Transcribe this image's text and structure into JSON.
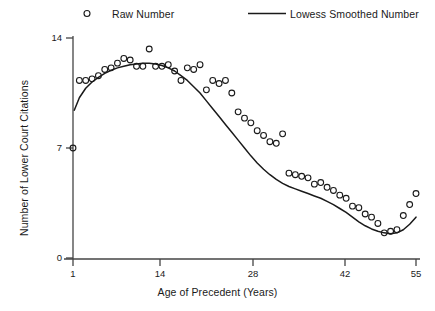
{
  "chart_data": {
    "type": "scatter",
    "title": "",
    "xlabel": "Age of Precedent (Years)",
    "ylabel": "Number of Lower Court Citations",
    "xlim": [
      1,
      55
    ],
    "ylim": [
      0,
      14.8
    ],
    "xticks": [
      1,
      14,
      28,
      42,
      55
    ],
    "yticks": [
      0,
      7,
      14
    ],
    "xtick_labels": [
      "1",
      "14",
      "28",
      "42",
      "55"
    ],
    "ytick_labels": [
      "0",
      "7",
      "14"
    ],
    "grid": false,
    "legend_position": "top",
    "legend": [
      {
        "label": "Raw Number",
        "marker": "circle",
        "color": "#1a1a1a"
      },
      {
        "label": "Lowess Smoothed Number",
        "marker": "line",
        "color": "#1a1a1a"
      }
    ],
    "series": [
      {
        "name": "Raw Number",
        "type": "scatter",
        "marker": "open-circle",
        "x": [
          1,
          2,
          3,
          4,
          5,
          6,
          7,
          8,
          9,
          10,
          11,
          12,
          13,
          14,
          15,
          16,
          17,
          18,
          19,
          20,
          21,
          22,
          23,
          24,
          25,
          26,
          27,
          28,
          29,
          30,
          31,
          32,
          33,
          34,
          35,
          36,
          37,
          38,
          39,
          40,
          41,
          42,
          43,
          44,
          45,
          46,
          47,
          48,
          49,
          50,
          51,
          52,
          53,
          54,
          55
        ],
        "y": [
          7.0,
          11.3,
          11.3,
          11.4,
          11.6,
          12.0,
          12.1,
          12.4,
          12.7,
          12.6,
          12.2,
          12.2,
          13.3,
          12.2,
          12.2,
          12.3,
          11.9,
          11.3,
          12.1,
          12.0,
          12.3,
          10.7,
          11.3,
          11.1,
          11.3,
          10.5,
          9.3,
          8.9,
          8.6,
          8.1,
          7.8,
          7.4,
          7.3,
          7.9,
          5.4,
          5.3,
          5.2,
          5.1,
          4.7,
          4.8,
          4.5,
          4.3,
          4.0,
          3.8,
          3.3,
          3.2,
          2.8,
          2.6,
          2.2,
          1.6,
          1.7,
          1.8,
          2.7,
          3.4,
          4.1
        ]
      },
      {
        "name": "Lowess Smoothed Number",
        "type": "line",
        "x": [
          1.2,
          2,
          3,
          4,
          5,
          6,
          7,
          8,
          9,
          10,
          11,
          12,
          13,
          14,
          15,
          16,
          17,
          18,
          19,
          20,
          21,
          22,
          23,
          24,
          25,
          26,
          27,
          28,
          29,
          30,
          31,
          32,
          33,
          34,
          35,
          36,
          37,
          38,
          39,
          40,
          41,
          42,
          43,
          44,
          45,
          46,
          47,
          48,
          49,
          50,
          51,
          52,
          53,
          54,
          55
        ],
        "y": [
          9.4,
          10.2,
          10.8,
          11.2,
          11.5,
          11.75,
          11.95,
          12.1,
          12.2,
          12.3,
          12.35,
          12.4,
          12.4,
          12.35,
          12.25,
          12.1,
          11.9,
          11.6,
          11.3,
          10.9,
          10.5,
          10.0,
          9.5,
          9.0,
          8.5,
          8.0,
          7.5,
          7.0,
          6.5,
          6.05,
          5.65,
          5.3,
          5.0,
          4.75,
          4.55,
          4.4,
          4.25,
          4.1,
          3.95,
          3.8,
          3.6,
          3.4,
          3.15,
          2.9,
          2.6,
          2.3,
          2.05,
          1.85,
          1.7,
          1.6,
          1.55,
          1.6,
          1.8,
          2.15,
          2.6
        ]
      }
    ]
  }
}
